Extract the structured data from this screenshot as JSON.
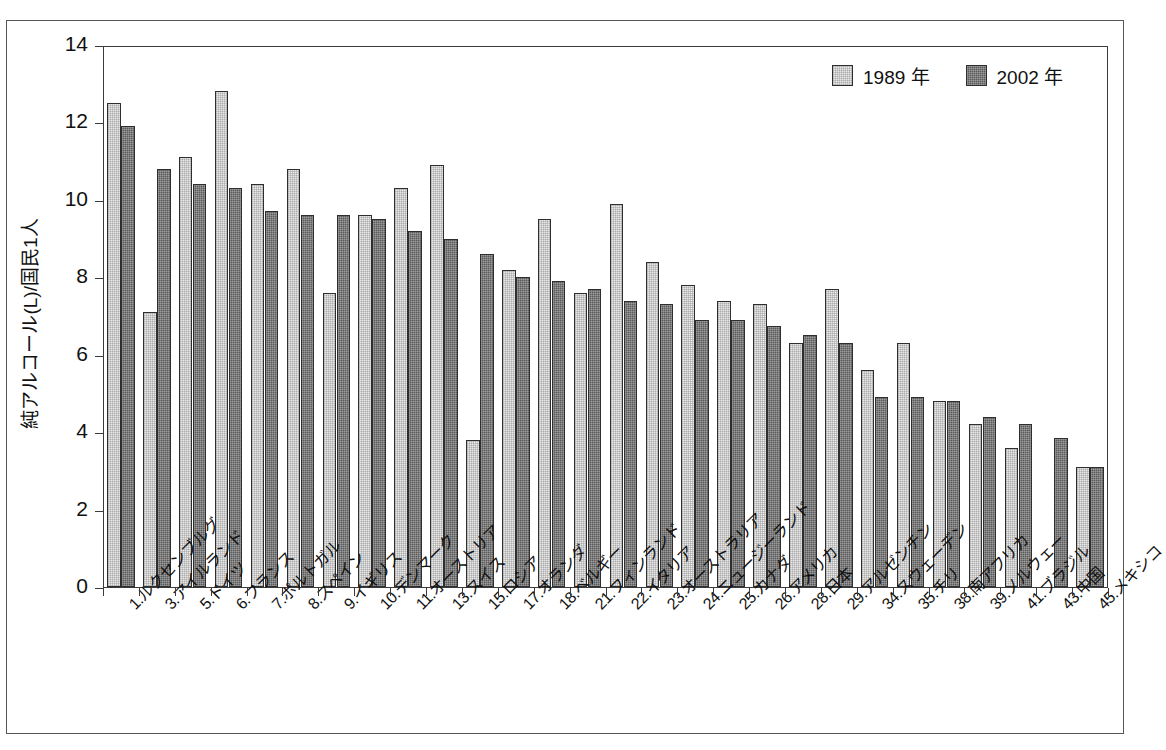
{
  "chart_data": {
    "type": "bar",
    "title": "",
    "subtitle": "",
    "xlabel": "",
    "ylabel": "純アルコール(L)/国民1人",
    "ylim": [
      0,
      14
    ],
    "yticks": [
      0,
      2,
      4,
      6,
      8,
      10,
      12,
      14
    ],
    "grid": false,
    "legend_position": "top-right",
    "categories": [
      "1.ルクセンブルグ",
      "3.アイルランド",
      "5.ドイツ",
      "6.フランス",
      "7.ポルトガル",
      "8.スペイン",
      "9.イギリス",
      "10.デンマーク",
      "11.オーストリア",
      "13.スイス",
      "15.ロシア",
      "17.オランダ",
      "18.ベルギー",
      "21.フィンランド",
      "22.イタリア",
      "23.オーストラリア",
      "24.ニュージーランド",
      "25.カナダ",
      "26.アメリカ",
      "28.日本",
      "29.アルゼンチン",
      "34.スウェーデン",
      "35.チリ",
      "38.南アフリカ",
      "39.ノルウェー",
      "41.ブラジル",
      "43.中国",
      "45.メキシコ"
    ],
    "series": [
      {
        "name": "1989 年",
        "color": "#e9e9e9",
        "values": [
          12.5,
          7.1,
          11.1,
          12.8,
          10.4,
          10.8,
          7.6,
          9.6,
          10.3,
          10.9,
          3.8,
          8.2,
          9.5,
          7.6,
          9.9,
          8.4,
          7.8,
          7.4,
          7.3,
          6.3,
          7.7,
          5.6,
          6.3,
          4.8,
          4.2,
          3.6,
          null,
          3.1
        ]
      },
      {
        "name": "2002 年",
        "color": "#5a5a5a",
        "values": [
          11.9,
          10.8,
          10.4,
          10.3,
          9.7,
          9.6,
          9.6,
          9.5,
          9.2,
          9.0,
          8.6,
          8.0,
          7.9,
          7.7,
          7.4,
          7.3,
          6.9,
          6.9,
          6.75,
          6.5,
          6.3,
          4.9,
          4.9,
          4.8,
          4.4,
          4.2,
          3.85,
          3.1
        ]
      }
    ]
  },
  "legend": {
    "items": [
      {
        "label": "1989 年",
        "series": "s1989"
      },
      {
        "label": "2002 年",
        "series": "s2002"
      }
    ]
  }
}
